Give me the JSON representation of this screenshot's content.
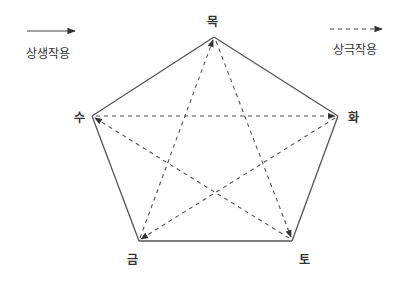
{
  "legend": {
    "generating": {
      "label": "상생작용",
      "style": "solid"
    },
    "overcoming": {
      "label": "상극작용",
      "style": "dashed"
    }
  },
  "nodes": [
    {
      "id": "wood",
      "label": "목",
      "x": 214,
      "y": 37
    },
    {
      "id": "fire",
      "label": "화",
      "x": 338,
      "y": 116
    },
    {
      "id": "earth",
      "label": "토",
      "x": 292,
      "y": 241
    },
    {
      "id": "metal",
      "label": "금",
      "x": 139,
      "y": 241
    },
    {
      "id": "water",
      "label": "수",
      "x": 92,
      "y": 116
    }
  ],
  "generating_edges": [
    {
      "from": "목",
      "to": "화"
    },
    {
      "from": "화",
      "to": "토"
    },
    {
      "from": "토",
      "to": "금"
    },
    {
      "from": "금",
      "to": "수"
    },
    {
      "from": "수",
      "to": "목"
    }
  ],
  "overcoming_edges": [
    {
      "from": "목",
      "to": "토"
    },
    {
      "from": "토",
      "to": "수"
    },
    {
      "from": "수",
      "to": "화"
    },
    {
      "from": "화",
      "to": "금"
    },
    {
      "from": "금",
      "to": "목"
    }
  ],
  "colors": {
    "line": "#444444",
    "text": "#333333",
    "background": "#ffffff"
  }
}
